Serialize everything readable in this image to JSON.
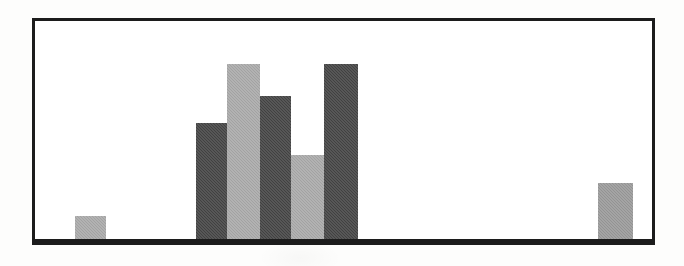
{
  "figure": {
    "background_color": "#fdfdfc",
    "frame_color": "#1c1c1c",
    "frame_border_width": 3,
    "frame": {
      "left": 32,
      "top": 18,
      "width": 623,
      "height": 227
    },
    "baseline_y": 244,
    "baseline_thickness": 3
  },
  "colors": {
    "dark_gray": "#444444",
    "light_gray": "#a9a9a9",
    "medium_gray": "#9a9a9a",
    "plot_background": "#ffffff",
    "axis": "#1c1c1c"
  },
  "chart_data": {
    "type": "bar",
    "title": "",
    "subtitle": "",
    "xlabel": "",
    "ylabel": "",
    "grid": false,
    "legend": null,
    "axis_ticks_visible": false,
    "tick_labels_visible": false,
    "categories": [
      "1",
      "2",
      "3",
      "4",
      "5",
      "6",
      "7",
      "8"
    ],
    "values": [
      0,
      26,
      119,
      178,
      146,
      87,
      178,
      0
    ],
    "ylim": [
      0,
      227
    ],
    "xlim": [
      0,
      623
    ],
    "note": "Values are bar pixel heights above the baseline; no numeric axis is printed on the figure.",
    "bars": [
      {
        "index": 0,
        "label": "",
        "value": 26,
        "color_name": "light_gray",
        "color": "#a9a9a9",
        "x": 40,
        "width": 31,
        "height": 26
      },
      {
        "index": 1,
        "label": "",
        "value": 119,
        "color_name": "dark_gray",
        "color": "#444444",
        "x": 161,
        "width": 31,
        "height": 119
      },
      {
        "index": 2,
        "label": "",
        "value": 178,
        "color_name": "light_gray",
        "color": "#a9a9a9",
        "x": 192,
        "width": 33,
        "height": 178
      },
      {
        "index": 3,
        "label": "",
        "value": 146,
        "color_name": "dark_gray",
        "color": "#444444",
        "x": 225,
        "width": 31,
        "height": 146
      },
      {
        "index": 4,
        "label": "",
        "value": 87,
        "color_name": "light_gray",
        "color": "#a9a9a9",
        "x": 256,
        "width": 33,
        "height": 87
      },
      {
        "index": 5,
        "label": "",
        "value": 178,
        "color_name": "dark_gray",
        "color": "#444444",
        "x": 289,
        "width": 34,
        "height": 178
      },
      {
        "index": 6,
        "label": "",
        "value": 59,
        "color_name": "medium_gray",
        "color": "#9a9a9a",
        "x": 563,
        "width": 35,
        "height": 59
      }
    ]
  }
}
